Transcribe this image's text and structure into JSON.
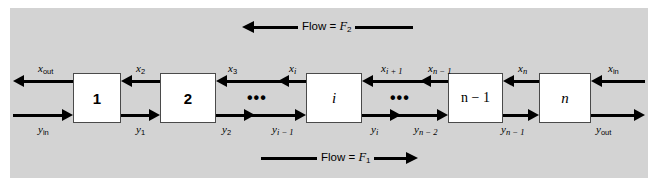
{
  "figure": {
    "panel_color": "#d3d3d3",
    "background_color": "#ffffff",
    "line_color": "#000000",
    "box_fill": "#ffffff"
  },
  "flows": {
    "top": {
      "label_prefix": "Flow = ",
      "symbol": "F",
      "subscript": "2",
      "direction": "left"
    },
    "bottom": {
      "label_prefix": "Flow = ",
      "symbol": "F",
      "subscript": "1",
      "direction": "right"
    }
  },
  "stages": [
    {
      "id": "stage-1",
      "label": "1"
    },
    {
      "id": "stage-2",
      "label": "2"
    },
    {
      "id": "stage-i",
      "label": "i"
    },
    {
      "id": "stage-n-1",
      "label": "n − 1"
    },
    {
      "id": "stage-n",
      "label": "n"
    }
  ],
  "ellipses": [
    "•••",
    "•••"
  ],
  "top_stream": {
    "description": "x-stream flowing right to left along the top of the stages",
    "labels": [
      {
        "var": "x",
        "sub": "out",
        "sub_italic": false
      },
      {
        "var": "x",
        "sub": "2",
        "sub_italic": false
      },
      {
        "var": "x",
        "sub": "3",
        "sub_italic": false
      },
      {
        "var": "x",
        "sub": "i",
        "sub_italic": true
      },
      {
        "var": "x",
        "sub": "i + 1",
        "sub_italic": true
      },
      {
        "var": "x",
        "sub": "n − 1",
        "sub_italic": true
      },
      {
        "var": "x",
        "sub": "n",
        "sub_italic": true
      },
      {
        "var": "x",
        "sub": "in",
        "sub_italic": false
      }
    ]
  },
  "bottom_stream": {
    "description": "y-stream flowing left to right along the bottom of the stages",
    "labels": [
      {
        "var": "y",
        "sub": "in",
        "sub_italic": false
      },
      {
        "var": "y",
        "sub": "1",
        "sub_italic": false
      },
      {
        "var": "y",
        "sub": "2",
        "sub_italic": false
      },
      {
        "var": "y",
        "sub": "i − 1",
        "sub_italic": true
      },
      {
        "var": "y",
        "sub": "i",
        "sub_italic": true
      },
      {
        "var": "y",
        "sub": "n − 2",
        "sub_italic": true
      },
      {
        "var": "y",
        "sub": "n − 1",
        "sub_italic": true
      },
      {
        "var": "y",
        "sub": "out",
        "sub_italic": false
      }
    ]
  }
}
